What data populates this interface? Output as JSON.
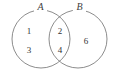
{
  "figure": {
    "type": "venn-diagram",
    "width": 119,
    "height": 79,
    "background_color": "#ffffff",
    "stroke_color": "#6e6e6e",
    "text_color": "#333333"
  },
  "sets": {
    "left": {
      "label": "A",
      "center_x": 41,
      "center_y": 39,
      "radius": 29
    },
    "right": {
      "label": "B",
      "center_x": 78,
      "center_y": 39,
      "radius": 29
    }
  },
  "regions": {
    "left_only": {
      "name": "A only",
      "elements": [
        "1",
        "3"
      ]
    },
    "intersection": {
      "name": "A and B",
      "elements": [
        "2",
        "4"
      ]
    },
    "right_only": {
      "name": "B only",
      "elements": [
        "6"
      ]
    }
  },
  "elements": {
    "one": "1",
    "two": "2",
    "three": "3",
    "four": "4",
    "six": "6"
  }
}
